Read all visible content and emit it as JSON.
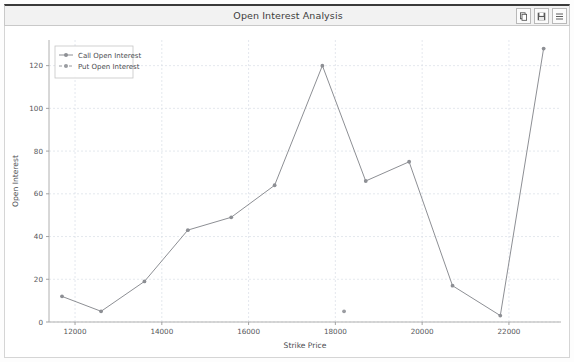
{
  "window": {
    "title": "Open Interest Analysis",
    "controls": [
      {
        "name": "copy-button",
        "icon": "copy-icon"
      },
      {
        "name": "save-button",
        "icon": "floppy-disk-icon"
      },
      {
        "name": "menu-button",
        "icon": "menu-icon"
      }
    ]
  },
  "colors": {
    "call_series": "#8d8f94",
    "put_series": "#9a9ca1",
    "grid": "#d9dee6",
    "axis": "#b0b0b0",
    "text": "#55565a",
    "panel_bg": "#ffffff",
    "titlebar_bg": "#f2f2f2"
  },
  "chart_data": {
    "type": "line",
    "title": "Open Interest Analysis",
    "xlabel": "Strike Price",
    "ylabel": "Open Interest",
    "xlim": [
      11400,
      23200
    ],
    "ylim": [
      0,
      132
    ],
    "xticks": [
      12000,
      14000,
      16000,
      18000,
      20000,
      22000
    ],
    "xticklabels": [
      "12000",
      "14000",
      "16000",
      "18000",
      "20000",
      "22000"
    ],
    "yticks": [
      0,
      20,
      40,
      60,
      80,
      100,
      120
    ],
    "yticklabels": [
      "0",
      "20",
      "40",
      "60",
      "80",
      "100",
      "120"
    ],
    "grid": true,
    "legend_position": "upper left",
    "series": [
      {
        "name": "Call Open Interest",
        "style": "solid",
        "marker": "circle",
        "x": [
          11700,
          12600,
          13600,
          14600,
          15600,
          16600,
          17700,
          18700,
          19700,
          20700,
          21800,
          22800
        ],
        "values": [
          12,
          5,
          19,
          43,
          49,
          64,
          120,
          66,
          75,
          17,
          3,
          128
        ]
      },
      {
        "name": "Put Open Interest",
        "style": "dashed",
        "marker": "circle",
        "x": [
          18200
        ],
        "values": [
          5
        ]
      }
    ]
  }
}
